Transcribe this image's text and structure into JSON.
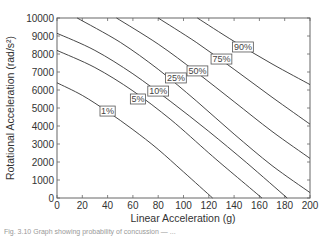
{
  "chart_data": {
    "type": "line",
    "title": "",
    "xlabel": "Linear Acceleration (g)",
    "ylabel": "Rotational Acceleration (rad/s²)",
    "xlim": [
      0,
      200
    ],
    "ylim": [
      0,
      10000
    ],
    "xticks": [
      0,
      20,
      40,
      60,
      80,
      100,
      120,
      140,
      160,
      180,
      200
    ],
    "yticks": [
      0,
      1000,
      2000,
      3000,
      4000,
      5000,
      6000,
      7000,
      8000,
      9000,
      10000
    ],
    "grid": false,
    "legend": "inline labels",
    "series": [
      {
        "name": "1%",
        "label_pos": [
          40,
          4830
        ],
        "points": [
          [
            0,
            6400
          ],
          [
            20,
            5700
          ],
          [
            40,
            4800
          ],
          [
            60,
            3800
          ],
          [
            80,
            2700
          ],
          [
            100,
            1450
          ],
          [
            123,
            0
          ]
        ]
      },
      {
        "name": "5%",
        "label_pos": [
          64,
          5500
        ],
        "points": [
          [
            0,
            8200
          ],
          [
            30,
            7250
          ],
          [
            60,
            5950
          ],
          [
            90,
            4350
          ],
          [
            120,
            2500
          ],
          [
            140,
            1300
          ],
          [
            162,
            0
          ]
        ]
      },
      {
        "name": "10%",
        "label_pos": [
          80,
          5940
        ],
        "points": [
          [
            0,
            9150
          ],
          [
            30,
            8200
          ],
          [
            60,
            6900
          ],
          [
            90,
            5350
          ],
          [
            120,
            3700
          ],
          [
            150,
            1950
          ],
          [
            182,
            0
          ]
        ]
      },
      {
        "name": "25%",
        "label_pos": [
          94,
          6670
        ],
        "points": [
          [
            16,
            10000
          ],
          [
            50,
            8650
          ],
          [
            80,
            7150
          ],
          [
            110,
            5400
          ],
          [
            140,
            3550
          ],
          [
            170,
            1800
          ],
          [
            200,
            300
          ]
        ]
      },
      {
        "name": "50%",
        "label_pos": [
          111,
          7060
        ],
        "points": [
          [
            47,
            10000
          ],
          [
            80,
            8550
          ],
          [
            110,
            7000
          ],
          [
            140,
            5350
          ],
          [
            170,
            3700
          ],
          [
            200,
            2200
          ]
        ]
      },
      {
        "name": "75%",
        "label_pos": [
          130,
          7720
        ],
        "points": [
          [
            80,
            10000
          ],
          [
            110,
            8650
          ],
          [
            140,
            7150
          ],
          [
            170,
            5600
          ],
          [
            200,
            4100
          ]
        ]
      },
      {
        "name": "90%",
        "label_pos": [
          147,
          8390
        ],
        "points": [
          [
            111,
            10000
          ],
          [
            140,
            8700
          ],
          [
            170,
            7450
          ],
          [
            200,
            6300
          ]
        ]
      }
    ]
  },
  "caption": "Fig. 3.10  Graph showing probability of concussion — ..."
}
